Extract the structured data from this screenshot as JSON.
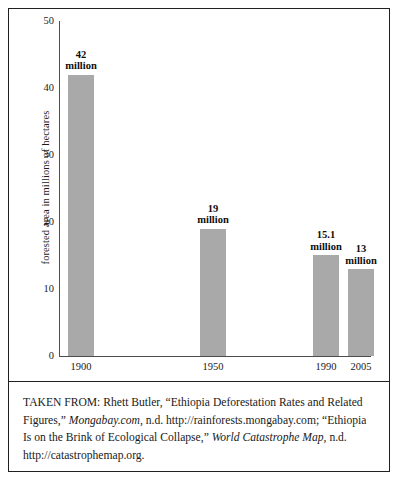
{
  "chart_data": {
    "type": "bar",
    "title": "",
    "xlabel": "",
    "ylabel": "forested area in millions of hectares",
    "categories": [
      "1900",
      "1950",
      "1990",
      "2005"
    ],
    "values": [
      42,
      19,
      15.1,
      13
    ],
    "value_labels": [
      "42\nmillion",
      "19\nmillion",
      "15.1\nmillion",
      "13\nmillion"
    ],
    "bars": [
      {
        "category": "1900",
        "value": 42,
        "label_line1": "42",
        "label_line2": "million"
      },
      {
        "category": "1950",
        "value": 19,
        "label_line1": "19",
        "label_line2": "million"
      },
      {
        "category": "1990",
        "value": 15.1,
        "label_line1": "15.1",
        "label_line2": "million"
      },
      {
        "category": "2005",
        "value": 13,
        "label_line1": "13",
        "label_line2": "million"
      }
    ],
    "ylim": [
      0,
      50
    ],
    "yticks": [
      "0",
      "10",
      "20",
      "30",
      "40",
      "50"
    ],
    "ytick_values": [
      0,
      10,
      20,
      30,
      40,
      50
    ],
    "grid": false,
    "legend": false,
    "bar_color": "#a9a9a9",
    "axis_color": "#4c4c4c"
  },
  "citation": {
    "line1_a": "TAKEN FROM: Rhett Butler, “Ethiopia Deforestation Rates and Related",
    "line2_a": "Figures,” ",
    "line2_it": "Mongabay.com",
    "line2_b": ", n.d. http://rainforests.mongabay.com;",
    "line3_a": "“Ethiopia Is on the Brink of Ecological Collapse,” ",
    "line3_it": "World Catastrophe",
    "line4_it": "Map",
    "line4_b": ", n.d. http://catastrophemap.org."
  }
}
